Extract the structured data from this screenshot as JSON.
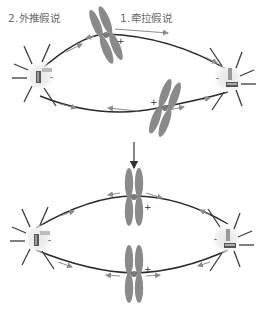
{
  "diagram": {
    "labels": {
      "pulling_hypothesis": "1.牵拉假说",
      "pushing_hypothesis": "2.外推假说"
    },
    "signs": {
      "plus": "+",
      "minus": "-"
    },
    "colors": {
      "chromosome": "#8a8a8a",
      "spindle_fiber": "#2a2a2a",
      "arrow": "#8c8c8c",
      "aster_ray": "#3a3a3a",
      "centrosome_glow": "#dcdcdc",
      "label_text": "#6a6a6a"
    },
    "panels": [
      {
        "name": "top-panel",
        "description": "chromosomes off-center, being pulled/pushed toward equator"
      },
      {
        "name": "bottom-panel",
        "description": "chromosomes aligned at metaphase plate"
      }
    ],
    "transition_arrow": "down"
  }
}
